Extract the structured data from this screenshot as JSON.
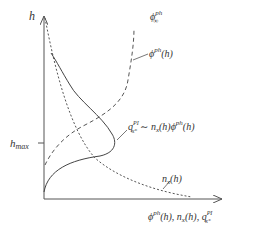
{
  "diagram": {
    "y_axis_label": "h",
    "x_axis_label": {
      "base": "ϕ",
      "sup": "ph",
      "rest": "(h), n",
      "sub1": "x",
      "rest2": "(h), q",
      "sub2": "x⁺",
      "sup2": "PI"
    },
    "tick_label": {
      "base": "h",
      "sub": "max"
    },
    "curves": [
      {
        "id": "phi-ph",
        "style": "dashed",
        "label": {
          "base": "ϕ",
          "sup": "ph",
          "rest": "(h)"
        }
      },
      {
        "id": "phi-inf",
        "style": "dashed",
        "label": {
          "base": "ϕ",
          "sup": "ph",
          "sub": "∞"
        }
      },
      {
        "id": "n-x",
        "style": "dotted",
        "label": {
          "base": "n",
          "sub": "x",
          "rest": "(h)"
        }
      },
      {
        "id": "q-PI",
        "style": "solid",
        "label": {
          "base": "q",
          "sub": "x⁺",
          "sup": "PI",
          "rest": " ∼ n",
          "sub2": "x",
          "rest2": "(h)ϕ",
          "sup2": "ph",
          "rest3": "(h)"
        }
      }
    ]
  }
}
